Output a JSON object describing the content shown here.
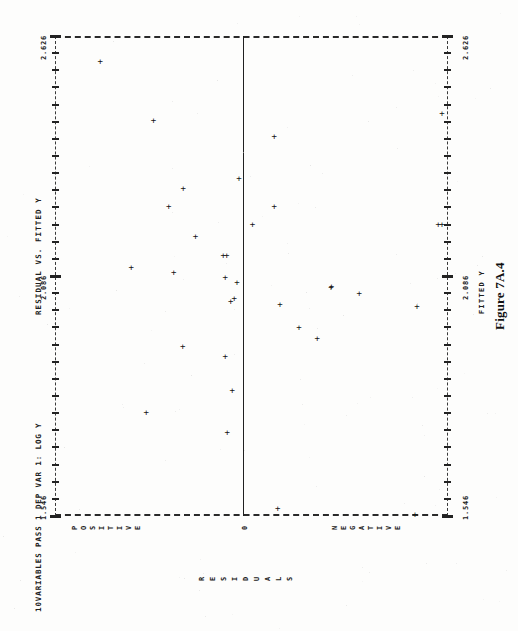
{
  "page": {
    "background": "#fdfdfc",
    "ink": "#1c1c1c"
  },
  "header": {
    "run_info": "10VARIABLES PASS 1  DEP VAR 1: LOG Y",
    "title": "RESIDUAL VS. FITTED Y"
  },
  "caption": "Figure 7A.4",
  "axes": {
    "fitted_label": "FITTED Y",
    "residual_label": "RESIDUALS",
    "tick_labels": [
      "1.546",
      "2.086",
      "2.626"
    ],
    "category_positive": "POSITIVE",
    "category_zero": "0",
    "category_negative": "NEGATIVE"
  },
  "chart_data": {
    "type": "scatter",
    "title": "RESIDUAL VS. FITTED Y",
    "subtitle": "10VARIABLES PASS 1  DEP VAR 1: LOG Y",
    "xlabel": "RESIDUALS",
    "ylabel": "FITTED Y",
    "orientation": "fitted-y on vertical axis, residuals on horizontal axis",
    "grid": false,
    "legend": "none",
    "marker": "+",
    "ylim": [
      1.546,
      2.626
    ],
    "ytick_values": [
      1.546,
      2.086,
      2.626
    ],
    "ytick_labels": [
      "1.546",
      "2.086",
      "2.626"
    ],
    "xtick_labels": [
      "POSITIVE",
      "0",
      "NEGATIVE"
    ],
    "zero_reference_line": true,
    "n_points": 33,
    "points": [
      {
        "fitted": 2.568,
        "residual": 0.289,
        "sign": "positive"
      },
      {
        "fitted": 2.436,
        "residual": 0.181,
        "sign": "positive"
      },
      {
        "fitted": 2.399,
        "residual": -0.063,
        "sign": "negative"
      },
      {
        "fitted": 2.452,
        "residual": -0.447,
        "sign": "negative"
      },
      {
        "fitted": 2.305,
        "residual": 0.008,
        "sign": "negative"
      },
      {
        "fitted": 2.283,
        "residual": 0.121,
        "sign": "positive"
      },
      {
        "fitted": 2.242,
        "residual": 0.15,
        "sign": "positive"
      },
      {
        "fitted": 2.243,
        "residual": -0.063,
        "sign": "negative"
      },
      {
        "fitted": 2.203,
        "residual": -0.019,
        "sign": "negative"
      },
      {
        "fitted": 2.203,
        "residual": -0.395,
        "sign": "negative"
      },
      {
        "fitted": 2.203,
        "residual": -0.489,
        "sign": "negative"
      },
      {
        "fitted": 2.174,
        "residual": 0.096,
        "sign": "positive"
      },
      {
        "fitted": 2.132,
        "residual": 0.04,
        "sign": "positive"
      },
      {
        "fitted": 2.132,
        "residual": 0.033,
        "sign": "positive"
      },
      {
        "fitted": 2.105,
        "residual": 0.226,
        "sign": "positive"
      },
      {
        "fitted": 2.093,
        "residual": 0.14,
        "sign": "positive"
      },
      {
        "fitted": 2.082,
        "residual": 0.036,
        "sign": "positive"
      },
      {
        "fitted": 2.072,
        "residual": 0.012,
        "sign": "positive"
      },
      {
        "fitted": 2.063,
        "residual": -0.179,
        "sign": "negative"
      },
      {
        "fitted": 2.06,
        "residual": -0.178,
        "sign": "negative"
      },
      {
        "fitted": 2.046,
        "residual": -0.235,
        "sign": "negative"
      },
      {
        "fitted": 2.036,
        "residual": 0.018,
        "sign": "positive"
      },
      {
        "fitted": 2.029,
        "residual": 0.025,
        "sign": "positive"
      },
      {
        "fitted": 2.022,
        "residual": -0.075,
        "sign": "negative"
      },
      {
        "fitted": 2.017,
        "residual": -0.352,
        "sign": "negative"
      },
      {
        "fitted": 1.97,
        "residual": -0.113,
        "sign": "negative"
      },
      {
        "fitted": 1.946,
        "residual": -0.15,
        "sign": "negative"
      },
      {
        "fitted": 1.928,
        "residual": 0.122,
        "sign": "positive"
      },
      {
        "fitted": 1.906,
        "residual": 0.036,
        "sign": "positive"
      },
      {
        "fitted": 1.828,
        "residual": 0.022,
        "sign": "positive"
      },
      {
        "fitted": 1.778,
        "residual": 0.196,
        "sign": "positive"
      },
      {
        "fitted": 1.735,
        "residual": 0.032,
        "sign": "positive"
      },
      {
        "fitted": 1.562,
        "residual": -0.07,
        "sign": "negative"
      },
      {
        "fitted": 1.55,
        "residual": -0.348,
        "sign": "negative"
      }
    ]
  },
  "layout": {
    "plot_px": {
      "left": 55,
      "top": 36,
      "width": 393,
      "height": 480
    },
    "zero_line_x_px": 243,
    "tick_positions_px": [
      516,
      276,
      36
    ]
  }
}
